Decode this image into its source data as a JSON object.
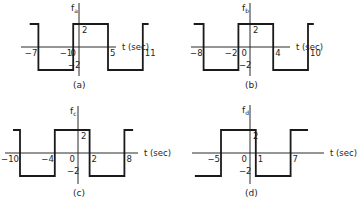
{
  "chart_data": [
    {
      "type": "line",
      "id": "a",
      "caption": "(a)",
      "ylabel": "f",
      "ylabel_sub": "a",
      "xlabel": "t (sec)",
      "amplitude": 2,
      "high_label": "2",
      "low_label": "-2",
      "tick_labels": [
        "-7",
        "-1",
        "0",
        "5",
        "11"
      ],
      "ticks": [
        -7,
        -1,
        0,
        5,
        11
      ],
      "segments": [
        {
          "t_start": -8.5,
          "t_end": -7,
          "value": 2
        },
        {
          "t_start": -7,
          "t_end": -1,
          "value": -2
        },
        {
          "t_start": -1,
          "t_end": 5,
          "value": 2
        },
        {
          "t_start": 5,
          "t_end": 11,
          "value": -2
        },
        {
          "t_start": 11,
          "t_end": 12,
          "value": 2
        }
      ],
      "period": 12,
      "geom": {
        "x0": 79,
        "yaxis": 47,
        "scale": 5.8,
        "amp_px": 23,
        "ax_left": 21,
        "ax_right": 150,
        "vtop": 3,
        "vbot": 76,
        "cap_y": 88,
        "cap_x": 73
      }
    },
    {
      "type": "line",
      "id": "b",
      "caption": "(b)",
      "ylabel": "f",
      "ylabel_sub": "b",
      "xlabel": "t (sec)",
      "amplitude": 2,
      "high_label": "2",
      "low_label": "-2",
      "tick_labels": [
        "-8",
        "-2",
        "0",
        "4",
        "10"
      ],
      "ticks": [
        -8,
        -2,
        0,
        4,
        10
      ],
      "segments": [
        {
          "t_start": -9.7,
          "t_end": -8,
          "value": 2
        },
        {
          "t_start": -8,
          "t_end": -2,
          "value": -2
        },
        {
          "t_start": -2,
          "t_end": 4,
          "value": 2
        },
        {
          "t_start": 4,
          "t_end": 10,
          "value": -2
        },
        {
          "t_start": 10,
          "t_end": 11,
          "value": 2
        }
      ],
      "period": 12,
      "geom": {
        "x0": 250,
        "yaxis": 47,
        "scale": 5.8,
        "amp_px": 23,
        "ax_left": 191,
        "ax_right": 324,
        "vtop": 3,
        "vbot": 76,
        "cap_y": 88,
        "cap_x": 245
      }
    },
    {
      "type": "line",
      "id": "c",
      "caption": "(c)",
      "ylabel": "f",
      "ylabel_sub": "c",
      "xlabel": "t (sec)",
      "amplitude": 2,
      "high_label": "2",
      "low_label": "-2",
      "tick_labels": [
        "-10",
        "-4",
        "0",
        "2",
        "8"
      ],
      "ticks": [
        -10,
        -4,
        0,
        2,
        8
      ],
      "segments": [
        {
          "t_start": -11.2,
          "t_end": -10,
          "value": 2
        },
        {
          "t_start": -10,
          "t_end": -4,
          "value": -2
        },
        {
          "t_start": -4,
          "t_end": 2,
          "value": 2
        },
        {
          "t_start": 2,
          "t_end": 8,
          "value": -2
        },
        {
          "t_start": 8,
          "t_end": 9.5,
          "value": 2
        }
      ],
      "period": 12,
      "geom": {
        "x0": 78,
        "yaxis": 153,
        "scale": 5.8,
        "amp_px": 23,
        "ax_left": 5,
        "ax_right": 172,
        "vtop": 106,
        "vbot": 184,
        "cap_y": 196,
        "cap_x": 73
      }
    },
    {
      "type": "line",
      "id": "d",
      "caption": "(d)",
      "ylabel": "f",
      "ylabel_sub": "d",
      "xlabel": "t (sec)",
      "amplitude": 2,
      "high_label": "2",
      "low_label": "-2",
      "tick_labels": [
        "-5",
        "0",
        "1",
        "7"
      ],
      "ticks": [
        -5,
        0,
        1,
        7
      ],
      "segments": [
        {
          "t_start": -9.5,
          "t_end": -5,
          "value": -2
        },
        {
          "t_start": -5,
          "t_end": 1,
          "value": 2
        },
        {
          "t_start": 1,
          "t_end": 7,
          "value": -2
        },
        {
          "t_start": 7,
          "t_end": 10,
          "value": 2
        }
      ],
      "period": 12,
      "geom": {
        "x0": 250,
        "yaxis": 153,
        "scale": 5.8,
        "amp_px": 23,
        "ax_left": 192,
        "ax_right": 358,
        "vtop": 105,
        "vbot": 184,
        "cap_y": 196,
        "cap_x": 245
      }
    }
  ]
}
